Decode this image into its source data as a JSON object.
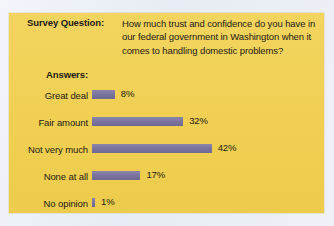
{
  "panel": {
    "background_color": "#f2d35c",
    "bar_color": "#7d77a0",
    "text_color": "#1d1a12"
  },
  "survey": {
    "question_label": "Survey Question:",
    "question_text": "How much trust and confidence do you have in our federal government in Washington when it comes to handling domestic problems?",
    "answers_label": "Answers:"
  },
  "chart_data": {
    "type": "bar",
    "orientation": "horizontal",
    "title": "How much trust and confidence do you have in our federal government in Washington when it comes to handling domestic problems?",
    "xlabel": "",
    "ylabel": "",
    "categories": [
      "Great deal",
      "Fair amount",
      "Not very much",
      "None at all",
      "No opinion"
    ],
    "values": [
      8,
      32,
      42,
      17,
      1
    ],
    "value_labels": [
      "8%",
      "32%",
      "42%",
      "17%",
      "1%"
    ],
    "xlim": [
      0,
      42
    ],
    "units": "%",
    "grid": false,
    "legend": "none",
    "series_color": "#7d77a0"
  }
}
